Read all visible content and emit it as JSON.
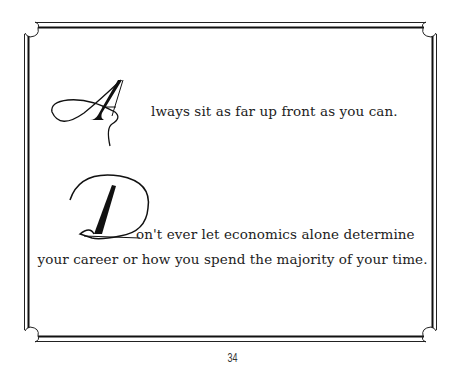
{
  "page": {
    "quotes": [
      {
        "initial": "A",
        "rest_line1": "lways sit as far up front as you can."
      },
      {
        "initial": "D",
        "rest_line1": "on't ever let economics alone determine",
        "line2": "your career or how you spend the majority of your time."
      }
    ],
    "page_number": "34"
  },
  "colors": {
    "ink": "#1a1a1a",
    "background": "#ffffff"
  }
}
